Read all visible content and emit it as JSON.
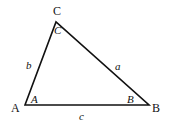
{
  "diagram": {
    "vertices": {
      "A": {
        "label": "A",
        "x": 25,
        "y": 105
      },
      "B": {
        "label": "B",
        "x": 149,
        "y": 105
      },
      "C": {
        "label": "C",
        "x": 56,
        "y": 22
      }
    },
    "angle_labels": {
      "A": "A",
      "B": "B",
      "C": "C"
    },
    "side_labels": {
      "a": "a",
      "b": "b",
      "c": "c"
    },
    "stroke_color": "#111111"
  }
}
